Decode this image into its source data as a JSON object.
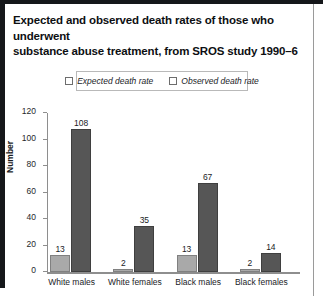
{
  "title": {
    "line1": "Expected and observed death rates of those who underwent",
    "line2": "substance abuse treatment, from SROS study 1990–6"
  },
  "legend": {
    "expected_label": "Expected death rate",
    "observed_label": "Observed death rate"
  },
  "colors": {
    "expected": "#a9a9a9",
    "observed": "#565656",
    "axis": "#8e8e8e",
    "text": "#1a1c1f"
  },
  "chart_data": {
    "type": "bar",
    "title": "Expected and observed death rates of those who underwent substance abuse treatment, from SROS study 1990–6",
    "categories": [
      "White males",
      "White females",
      "Black males",
      "Black females"
    ],
    "series": [
      {
        "name": "Expected death rate",
        "values": [
          13,
          2,
          13,
          2
        ]
      },
      {
        "name": "Observed death rate",
        "values": [
          108,
          35,
          67,
          14
        ]
      }
    ],
    "xlabel": "",
    "ylabel": "Number",
    "ylim": [
      0,
      120
    ],
    "yticks": [
      0,
      20,
      40,
      60,
      80,
      100,
      120
    ],
    "grid": false,
    "legend_position": "top"
  }
}
